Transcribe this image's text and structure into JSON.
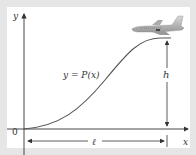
{
  "diagram": {
    "axes": {
      "x_label": "x",
      "y_label": "y",
      "origin_label": "0"
    },
    "curve": {
      "label": "y = P(x)",
      "color": "#555555",
      "description": "smooth S-shaped curve rising from the origin to a horizontal level at height h, ending at horizontal distance ℓ"
    },
    "dimensions": {
      "height_label": "h",
      "length_label": "ℓ"
    },
    "object": {
      "name": "airplane",
      "description": "gray jet aircraft flying level at the top right of the curve"
    },
    "colors": {
      "background": "#e6e6e6",
      "panel": "#ffffff",
      "ink": "#333333"
    }
  }
}
